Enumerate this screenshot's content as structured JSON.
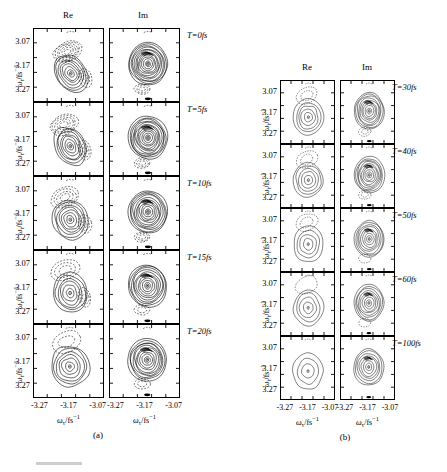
{
  "figure": {
    "caption_a": "(a)",
    "caption_b": "(b)"
  },
  "axes": {
    "y_label": "ω_t/fs⁻¹",
    "x_label": "ω_τ/fs⁻¹",
    "y_ticks": [
      "3.07",
      "3.17",
      "3.27"
    ],
    "x_ticks": [
      "-3.27",
      "-3.17",
      "-3.07"
    ],
    "y_range": [
      3.02,
      3.32
    ],
    "x_range": [
      -3.32,
      -3.02
    ],
    "y_inverted": true
  },
  "columns": [
    {
      "key": "re",
      "label": "Re"
    },
    {
      "key": "im",
      "label": "Im"
    }
  ],
  "panel_a": {
    "caption": "(a)",
    "rows": [
      {
        "label": "T=0fs",
        "delay_fs": 0
      },
      {
        "label": "T=5fs",
        "delay_fs": 5
      },
      {
        "label": "T=10fs",
        "delay_fs": 10
      },
      {
        "label": "T=15fs",
        "delay_fs": 15
      },
      {
        "label": "T=20fs",
        "delay_fs": 20
      }
    ]
  },
  "panel_b": {
    "caption": "(b)",
    "rows": [
      {
        "label": "T=30fs",
        "delay_fs": 30
      },
      {
        "label": "T=40fs",
        "delay_fs": 40
      },
      {
        "label": "T=50fs",
        "delay_fs": 50
      },
      {
        "label": "T=60fs",
        "delay_fs": 60
      },
      {
        "label": "T=100fs",
        "delay_fs": 100
      }
    ]
  },
  "chart_data": {
    "type": "contour",
    "title": "",
    "xlabel": "ω_τ/fs⁻¹",
    "ylabel": "ω_t/fs⁻¹",
    "xlim": [
      -3.32,
      -3.02
    ],
    "ylim": [
      3.32,
      3.02
    ],
    "xticks": [
      -3.27,
      -3.17,
      -3.07
    ],
    "yticks": [
      3.07,
      3.17,
      3.27
    ],
    "grid": false,
    "legend": false,
    "line_styles": {
      "positive": "solid",
      "negative": "dashed"
    },
    "panels": [
      {
        "panel": "a",
        "waiting_times_fs": [
          0,
          5,
          10,
          15,
          20
        ],
        "cells": [
          {
            "T": 0,
            "part": "Re",
            "peak_xy": [
              -3.16,
              3.135
            ],
            "peak_level": 7,
            "n_positive_contours": 7,
            "n_negative_contours": 6,
            "negative_lobe_xy": [
              -3.175,
              3.225
            ],
            "elongation": "diagonal",
            "tilt_deg": 38
          },
          {
            "T": 0,
            "part": "Im",
            "peak_xy": [
              -3.155,
              3.175
            ],
            "peak_level": 12,
            "n_positive_contours": 12,
            "n_negative_contours": 3,
            "negative_lobe_xy": [
              -3.18,
              3.07
            ],
            "elongation": "round",
            "tilt_deg": 15
          },
          {
            "T": 5,
            "part": "Re",
            "peak_xy": [
              -3.162,
              3.14
            ],
            "peak_level": 7,
            "n_positive_contours": 7,
            "n_negative_contours": 5,
            "negative_lobe_xy": [
              -3.19,
              3.23
            ],
            "elongation": "diagonal",
            "tilt_deg": 30
          },
          {
            "T": 5,
            "part": "Im",
            "peak_xy": [
              -3.155,
              3.175
            ],
            "peak_level": 12,
            "n_positive_contours": 12,
            "n_negative_contours": 3,
            "negative_lobe_xy": [
              -3.18,
              3.07
            ],
            "elongation": "round",
            "tilt_deg": 12
          },
          {
            "T": 10,
            "part": "Re",
            "peak_xy": [
              -3.162,
              3.142
            ],
            "peak_level": 7,
            "n_positive_contours": 7,
            "n_negative_contours": 4,
            "negative_lobe_xy": [
              -3.185,
              3.235
            ],
            "elongation": "oval",
            "tilt_deg": 22
          },
          {
            "T": 10,
            "part": "Im",
            "peak_xy": [
              -3.155,
              3.175
            ],
            "peak_level": 11,
            "n_positive_contours": 11,
            "n_negative_contours": 3,
            "negative_lobe_xy": [
              -3.18,
              3.07
            ],
            "elongation": "round",
            "tilt_deg": 10
          },
          {
            "T": 15,
            "part": "Re",
            "peak_xy": [
              -3.163,
              3.145
            ],
            "peak_level": 6,
            "n_positive_contours": 6,
            "n_negative_contours": 3,
            "negative_lobe_xy": [
              -3.185,
              3.24
            ],
            "elongation": "oval",
            "tilt_deg": 15
          },
          {
            "T": 15,
            "part": "Im",
            "peak_xy": [
              -3.157,
              3.175
            ],
            "peak_level": 10,
            "n_positive_contours": 10,
            "n_negative_contours": 2,
            "negative_lobe_xy": [
              -3.18,
              3.075
            ],
            "elongation": "round",
            "tilt_deg": 8
          },
          {
            "T": 20,
            "part": "Re",
            "peak_xy": [
              -3.164,
              3.147
            ],
            "peak_level": 6,
            "n_positive_contours": 6,
            "n_negative_contours": 2,
            "negative_lobe_xy": [
              -3.18,
              3.25
            ],
            "elongation": "round",
            "tilt_deg": 10
          },
          {
            "T": 20,
            "part": "Im",
            "peak_xy": [
              -3.158,
              3.175
            ],
            "peak_level": 10,
            "n_positive_contours": 10,
            "n_negative_contours": 2,
            "negative_lobe_xy": [
              -3.18,
              3.075
            ],
            "elongation": "round",
            "tilt_deg": 6
          }
        ]
      },
      {
        "panel": "b",
        "waiting_times_fs": [
          30,
          40,
          50,
          60,
          100
        ],
        "cells": [
          {
            "T": 30,
            "part": "Re",
            "peak_xy": [
              -3.165,
              3.145
            ],
            "peak_level": 5,
            "n_positive_contours": 5,
            "n_negative_contours": 2,
            "negative_lobe_xy": [
              -3.175,
              3.25
            ],
            "elongation": "round",
            "tilt_deg": 8
          },
          {
            "T": 30,
            "part": "Im",
            "peak_xy": [
              -3.16,
              3.175
            ],
            "peak_level": 9,
            "n_positive_contours": 9,
            "n_negative_contours": 2,
            "negative_lobe_xy": [
              -3.185,
              3.075
            ],
            "elongation": "round",
            "tilt_deg": 6
          },
          {
            "T": 40,
            "part": "Re",
            "peak_xy": [
              -3.165,
              3.15
            ],
            "peak_level": 5,
            "n_positive_contours": 5,
            "n_negative_contours": 2,
            "negative_lobe_xy": [
              -3.175,
              3.25
            ],
            "elongation": "round",
            "tilt_deg": 5
          },
          {
            "T": 40,
            "part": "Im",
            "peak_xy": [
              -3.16,
              3.175
            ],
            "peak_level": 9,
            "n_positive_contours": 9,
            "n_negative_contours": 2,
            "negative_lobe_xy": [
              -3.185,
              3.08
            ],
            "elongation": "round",
            "tilt_deg": 5
          },
          {
            "T": 50,
            "part": "Re",
            "peak_xy": [
              -3.166,
              3.15
            ],
            "peak_level": 4,
            "n_positive_contours": 4,
            "n_negative_contours": 2,
            "negative_lobe_xy": [
              -3.175,
              3.255
            ],
            "elongation": "round",
            "tilt_deg": 4
          },
          {
            "T": 50,
            "part": "Im",
            "peak_xy": [
              -3.16,
              3.175
            ],
            "peak_level": 8,
            "n_positive_contours": 8,
            "n_negative_contours": 1,
            "negative_lobe_xy": [
              -3.185,
              3.08
            ],
            "elongation": "round",
            "tilt_deg": 4
          },
          {
            "T": 60,
            "part": "Re",
            "peak_xy": [
              -3.166,
              3.152
            ],
            "peak_level": 4,
            "n_positive_contours": 4,
            "n_negative_contours": 1,
            "negative_lobe_xy": [
              -3.175,
              3.26
            ],
            "elongation": "round",
            "tilt_deg": 3
          },
          {
            "T": 60,
            "part": "Im",
            "peak_xy": [
              -3.162,
              3.175
            ],
            "peak_level": 8,
            "n_positive_contours": 8,
            "n_negative_contours": 1,
            "negative_lobe_xy": [
              -3.185,
              3.08
            ],
            "elongation": "round",
            "tilt_deg": 3
          },
          {
            "T": 100,
            "part": "Re",
            "peak_xy": [
              -3.167,
              3.155
            ],
            "peak_level": 3,
            "n_positive_contours": 3,
            "n_negative_contours": 0,
            "negative_lobe_xy": null,
            "elongation": "round",
            "tilt_deg": 0
          },
          {
            "T": 100,
            "part": "Im",
            "peak_xy": [
              -3.163,
              3.175
            ],
            "peak_level": 7,
            "n_positive_contours": 7,
            "n_negative_contours": 0,
            "negative_lobe_xy": null,
            "elongation": "round",
            "tilt_deg": 0
          }
        ]
      }
    ]
  }
}
